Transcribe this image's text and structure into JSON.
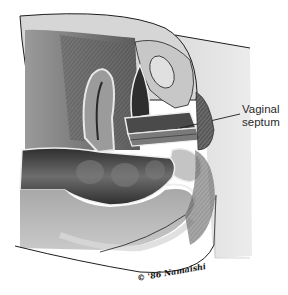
{
  "figure": {
    "type": "medical-illustration",
    "view": "sagittal section, grayscale",
    "labels": [
      {
        "id": "vaginal-septum",
        "line1": "Vaginal",
        "line2": "septum"
      }
    ],
    "signature": "© '86 Namaishi",
    "colors": {
      "background": "#ffffff",
      "skin": "#e4e4e4",
      "outline": "#1e1e1e",
      "dark_tissue": "#3a3a3a",
      "mid_tissue": "#8c8c8c",
      "light_tissue": "#cfcfcf",
      "label_text": "#2a2a2a"
    }
  }
}
